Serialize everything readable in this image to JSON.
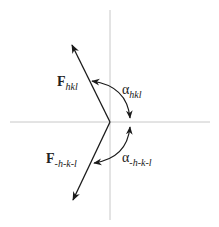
{
  "diagram": {
    "labels": {
      "f_hkl": {
        "main": "F",
        "sub": "hkl"
      },
      "f_neg": {
        "main": "F",
        "sub": "-h-k-l"
      },
      "alpha_hkl": {
        "main": "α",
        "sub": "hkl"
      },
      "alpha_neg": {
        "main": "α",
        "sub": "-h-k-l"
      }
    },
    "colors": {
      "axis": "#c8c8c8",
      "vector": "#1a1a1a"
    }
  }
}
